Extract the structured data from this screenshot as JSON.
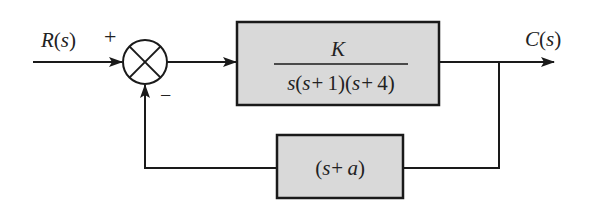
{
  "diagram": {
    "type": "feedback-control-block-diagram",
    "input_signal": {
      "name": "R",
      "arg": "s"
    },
    "output_signal": {
      "name": "C",
      "arg": "s"
    },
    "summing_junction": {
      "plus_sign": "+",
      "minus_sign": "−",
      "plus_input": "R(s)",
      "minus_input": "feedback"
    },
    "forward_block": {
      "numerator": "K",
      "denominator": "s(s+1)(s+4)",
      "numerator_parts": [
        {
          "t": "K",
          "i": true
        }
      ],
      "denominator_parts": [
        {
          "t": "s",
          "i": true
        },
        {
          "t": "(",
          "i": false
        },
        {
          "t": "s",
          "i": true
        },
        {
          "t": "+",
          "i": false
        },
        {
          "t": "1)(",
          "i": false
        },
        {
          "t": "s",
          "i": true
        },
        {
          "t": "+",
          "i": false
        },
        {
          "t": "4)",
          "i": false
        }
      ]
    },
    "feedback_block": {
      "transfer_function": "(s+a)"
    },
    "colors": {
      "block_fill": "#d9d9d9",
      "line": "#1a1a1a",
      "background": "#ffffff"
    }
  }
}
